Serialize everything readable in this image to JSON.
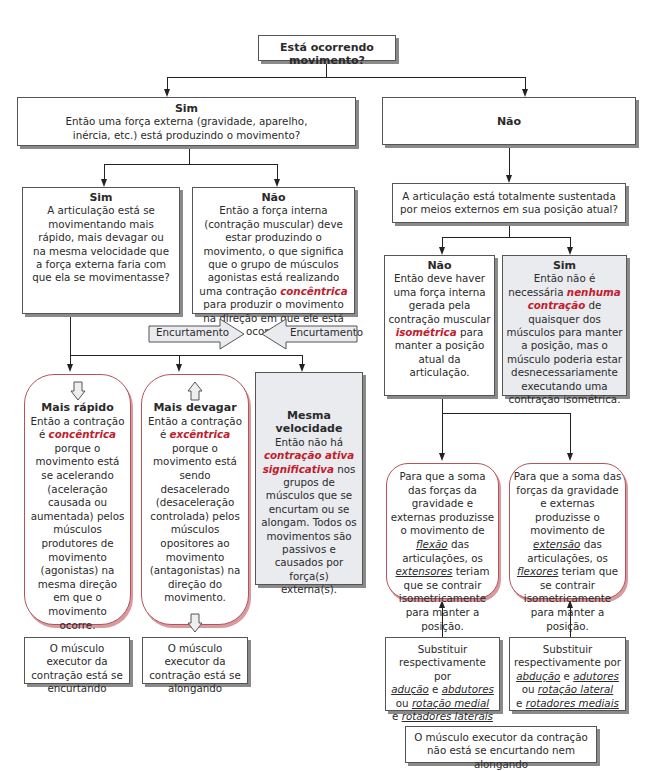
{
  "root": {
    "question": "Está ocorrendo movimento?"
  },
  "yes_branch": {
    "title": "Sim",
    "text": "Então uma força externa (gravidade, aparelho, inércia, etc.) está produzindo o movimento?",
    "yes": {
      "title": "Sim",
      "text": "A articulação está se movimentando mais rápido, mais devagar ou na mesma velocidade que a força externa faria com que ela se movimentasse?"
    },
    "no": {
      "title": "Não",
      "text_before": "Então a força interna (contração muscular) deve estar produzindo o movimento, o que significa que o grupo de músculos agonistas está realizando uma contração",
      "highlight": "concêntrica",
      "text_after": "para produzir o movimento na direção em que ele está ocorrendo."
    },
    "arrows": {
      "left": "Encurtamento",
      "right": "Encurtamento"
    },
    "faster": {
      "title": "Mais rápido",
      "line1": "Então a contração",
      "pre": "é",
      "highlight": "concêntrica",
      "text": "porque o movimento está se acelerando (aceleração causada ou aumentada) pelos músculos produtores de movimento (agonistas) na mesma direção em que o movimento ocorre.",
      "top_icon": "hollow-arrow-down-icon",
      "bottom_icon": "hollow-arrow-up-icon",
      "note": "O músculo executor da contração está se encurtando"
    },
    "slower": {
      "title": "Mais devagar",
      "line1": "Então a contração",
      "pre": "é",
      "highlight": "excêntrica",
      "text": "porque o movimento está sendo desacelerado (desaceleração controlada) pelos músculos opositores ao movimento (antagonistas) na direção do movimento.",
      "top_icon": "hollow-arrow-up-icon",
      "bottom_icon": "hollow-arrow-down-icon",
      "note": "O músculo executor da contração está se alongando"
    },
    "same": {
      "title": "Mesma velocidade",
      "line1": "Então não há",
      "highlight": "contração ativa significativa",
      "text": "nos grupos de músculos que se encurtam ou se alongam. Todos os movimentos são passivos e causados por força(s) externa(s)."
    }
  },
  "no_branch": {
    "title": "Não",
    "question": "A articulação está totalmente sustentada por meios externos em sua posição atual?",
    "no": {
      "title": "Não",
      "text_before": "Então deve haver uma força interna gerada pela contração muscular",
      "highlight": "isométrica",
      "text_after": "para manter a posição atual da articulação."
    },
    "yes": {
      "title": "Sim",
      "text_before": "Então não é necessária",
      "highlight": "nenhuma contração",
      "text_after": "de quaisquer dos músculos para manter a posição, mas o músculo poderia estar desnecessariamente executando uma contração isométrica."
    },
    "flexion": {
      "a": "Para que a soma das forças da gravidade e externas produzisse o movimento de",
      "u1": "flexão",
      "b": "das articulações, os",
      "u2": "extensores",
      "c": "teriam que se contrair isometricamente para manter a posição."
    },
    "extension": {
      "a": "Para que a soma das forças da gravidade e externas produzisse o movimento de",
      "u1": "extensão",
      "b": "das articulações, os",
      "u2": "flexores",
      "c": "teriam que se contrair isometricamente para manter a posição."
    },
    "subst_left": {
      "a": "Substituir respectivamente por",
      "u1": "adução",
      "e1": "e",
      "u2": "abdutores",
      "ou": "ou",
      "u3": "rotação medial",
      "e2": "e",
      "u4": "rotadores laterais"
    },
    "subst_right": {
      "a": "Substituir respectivamente por",
      "u1": "abdução",
      "e1": "e",
      "u2": "adutores",
      "ou": "ou",
      "u3": "rotação lateral",
      "e2": "e",
      "u4": "rotadores mediais"
    },
    "note": "O músculo executor da contração não está se encurtando nem alongando"
  },
  "colors": {
    "accent": "#c0202c",
    "round_border": "#b5525a",
    "gray_fill": "#e9ebef"
  }
}
